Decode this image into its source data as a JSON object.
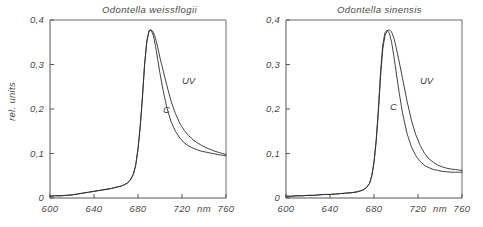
{
  "figure": {
    "ylabel": "rel. units",
    "xunit": "nm"
  },
  "panels": [
    {
      "id": "left",
      "title": "Odontella weissflogii",
      "labels": {
        "uv": "UV",
        "c": "C"
      }
    },
    {
      "id": "right",
      "title": "Odontella sinensis",
      "labels": {
        "uv": "UV",
        "c": "C"
      }
    }
  ],
  "axes": {
    "yticks": [
      "0",
      "0,1",
      "0,2",
      "0,3",
      "0,4"
    ],
    "xticks": [
      "600",
      "640",
      "680",
      "720",
      "760"
    ]
  },
  "chart_data": {
    "type": "line",
    "xlabel": "nm",
    "ylabel": "rel. units",
    "xlim": [
      600,
      760
    ],
    "ylim": [
      0,
      0.4
    ],
    "grid": false,
    "legend": "inline-annotations",
    "panels": [
      {
        "title": "Odontella weissflogii",
        "series": [
          {
            "name": "C",
            "annotation": "C",
            "x": [
              600,
              605,
              610,
              615,
              620,
              625,
              630,
              635,
              640,
              645,
              650,
              655,
              660,
              665,
              670,
              673,
              676,
              678,
              680,
              682,
              684,
              686,
              688,
              690,
              692,
              694,
              696,
              698,
              700,
              703,
              706,
              710,
              714,
              718,
              722,
              726,
              730,
              734,
              738,
              742,
              746,
              750,
              754,
              757,
              760
            ],
            "y": [
              0.004,
              0.005,
              0.005,
              0.006,
              0.007,
              0.009,
              0.011,
              0.013,
              0.015,
              0.017,
              0.019,
              0.021,
              0.024,
              0.027,
              0.033,
              0.04,
              0.055,
              0.075,
              0.11,
              0.16,
              0.225,
              0.3,
              0.352,
              0.375,
              0.377,
              0.365,
              0.34,
              0.31,
              0.28,
              0.24,
              0.205,
              0.172,
              0.15,
              0.135,
              0.124,
              0.117,
              0.112,
              0.108,
              0.105,
              0.103,
              0.101,
              0.099,
              0.097,
              0.096,
              0.095
            ]
          },
          {
            "name": "UV",
            "annotation": "UV",
            "x": [
              600,
              605,
              610,
              615,
              620,
              625,
              630,
              635,
              640,
              645,
              650,
              655,
              660,
              665,
              670,
              673,
              676,
              678,
              680,
              682,
              684,
              686,
              688,
              690,
              692,
              694,
              696,
              698,
              700,
              703,
              706,
              710,
              714,
              718,
              722,
              726,
              730,
              734,
              738,
              742,
              746,
              750,
              754,
              757,
              760
            ],
            "y": [
              0.004,
              0.005,
              0.005,
              0.006,
              0.007,
              0.009,
              0.011,
              0.013,
              0.015,
              0.017,
              0.019,
              0.021,
              0.024,
              0.027,
              0.033,
              0.04,
              0.055,
              0.075,
              0.11,
              0.16,
              0.225,
              0.3,
              0.352,
              0.376,
              0.378,
              0.372,
              0.358,
              0.338,
              0.315,
              0.285,
              0.255,
              0.218,
              0.19,
              0.168,
              0.152,
              0.14,
              0.131,
              0.124,
              0.118,
              0.113,
              0.109,
              0.105,
              0.102,
              0.1,
              0.098
            ]
          }
        ]
      },
      {
        "title": "Odontella sinensis",
        "series": [
          {
            "name": "C",
            "annotation": "C",
            "x": [
              600,
              605,
              610,
              615,
              620,
              625,
              630,
              635,
              640,
              645,
              650,
              655,
              660,
              665,
              670,
              673,
              676,
              678,
              680,
              682,
              684,
              686,
              688,
              690,
              692,
              694,
              696,
              698,
              700,
              703,
              706,
              710,
              714,
              718,
              722,
              726,
              730,
              734,
              738,
              742,
              746,
              750,
              754,
              757,
              760
            ],
            "y": [
              0.004,
              0.004,
              0.005,
              0.005,
              0.006,
              0.006,
              0.007,
              0.008,
              0.008,
              0.009,
              0.01,
              0.011,
              0.012,
              0.014,
              0.018,
              0.023,
              0.033,
              0.05,
              0.08,
              0.13,
              0.2,
              0.285,
              0.345,
              0.372,
              0.377,
              0.37,
              0.35,
              0.32,
              0.285,
              0.235,
              0.19,
              0.145,
              0.115,
              0.095,
              0.082,
              0.073,
              0.068,
              0.064,
              0.062,
              0.06,
              0.059,
              0.058,
              0.058,
              0.058,
              0.058
            ]
          },
          {
            "name": "UV",
            "annotation": "UV",
            "x": [
              600,
              605,
              610,
              615,
              620,
              625,
              630,
              635,
              640,
              645,
              650,
              655,
              660,
              665,
              670,
              673,
              676,
              678,
              680,
              682,
              684,
              686,
              688,
              690,
              692,
              694,
              696,
              698,
              700,
              703,
              706,
              710,
              714,
              718,
              722,
              726,
              730,
              734,
              738,
              742,
              746,
              750,
              754,
              757,
              760
            ],
            "y": [
              0.004,
              0.004,
              0.005,
              0.005,
              0.006,
              0.006,
              0.007,
              0.008,
              0.008,
              0.009,
              0.01,
              0.011,
              0.012,
              0.014,
              0.018,
              0.023,
              0.033,
              0.05,
              0.08,
              0.128,
              0.195,
              0.275,
              0.335,
              0.365,
              0.376,
              0.378,
              0.373,
              0.36,
              0.34,
              0.305,
              0.268,
              0.218,
              0.175,
              0.142,
              0.118,
              0.1,
              0.088,
              0.08,
              0.074,
              0.07,
              0.067,
              0.065,
              0.064,
              0.063,
              0.062
            ]
          }
        ]
      }
    ]
  }
}
